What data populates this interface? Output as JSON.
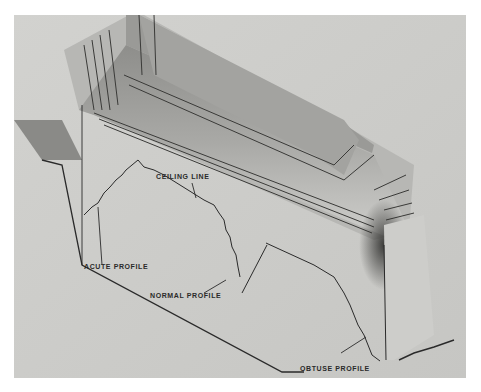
{
  "figure": {
    "kind": "photograph",
    "labels": {
      "ceiling_line": "CEILING LINE",
      "acute_profile": "ACUTE PROFILE",
      "normal_profile": "NORMAL PROFILE",
      "obtuse_profile": "OBTUSE PROFILE"
    },
    "colors": {
      "background": "#c9c9c7",
      "line": "#2a2a2a",
      "page": "#ffffff"
    }
  }
}
